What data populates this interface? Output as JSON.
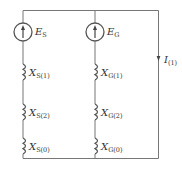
{
  "diagram": {
    "type": "equivalent-circuit",
    "colors": {
      "line": "#777777",
      "text": "#333333",
      "background": "#ffffff"
    },
    "sources": [
      {
        "id": "ES",
        "symbol": "E",
        "subscript": "S"
      },
      {
        "id": "EG",
        "symbol": "E",
        "subscript": "G"
      }
    ],
    "reactances": {
      "S": [
        {
          "symbol": "X",
          "subscript": "S(1)"
        },
        {
          "symbol": "X",
          "subscript": "S(2)"
        },
        {
          "symbol": "X",
          "subscript": "S(0)"
        }
      ],
      "G": [
        {
          "symbol": "X",
          "subscript": "G(1)"
        },
        {
          "symbol": "X",
          "subscript": "G(2)"
        },
        {
          "symbol": "X",
          "subscript": "G(0)"
        }
      ]
    },
    "current": {
      "symbol": "I",
      "subscript": "(1)"
    }
  }
}
